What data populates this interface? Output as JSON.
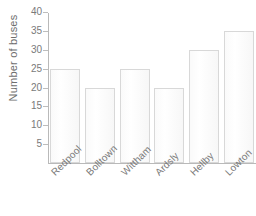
{
  "chart_data": {
    "type": "bar",
    "title": "",
    "xlabel": "",
    "ylabel": "Number of buses",
    "categories": [
      "Redpool",
      "Bolltown",
      "Wittham",
      "Ardsly",
      "Hellby",
      "Lowton"
    ],
    "values": [
      25,
      20,
      25,
      20,
      30,
      35
    ],
    "ylim": [
      0,
      40
    ],
    "ytick_values": [
      5,
      10,
      15,
      20,
      25,
      30,
      35,
      40
    ],
    "ytick_labels": [
      "5",
      "10",
      "15",
      "20",
      "25",
      "30",
      "35",
      "40"
    ],
    "grid": false,
    "legend": false,
    "bar_fill_color": "#fbfbfb",
    "bar_border_color": "#d8d8d8",
    "axis_color": "#b9b9b9",
    "text_color": "#7a7a7a"
  }
}
